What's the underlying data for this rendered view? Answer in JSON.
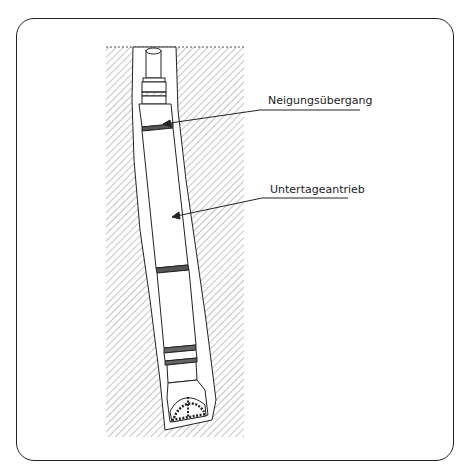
{
  "figure": {
    "type": "technical-illustration",
    "labels": [
      {
        "id": "bent-sub",
        "text": "Neigungsübergang"
      },
      {
        "id": "downhole-motor",
        "text": "Untertageantrieb"
      }
    ],
    "colors": {
      "line": "#222222",
      "hatch": "#888888",
      "background": "#ffffff"
    }
  }
}
